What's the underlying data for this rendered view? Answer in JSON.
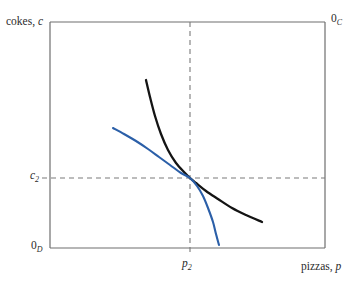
{
  "chart_data": {
    "type": "line",
    "title": "",
    "xlabel": "pizzas, p",
    "ylabel": "cokes, c",
    "grid": false,
    "legend_position": "none",
    "origin_labels": {
      "bottom_left": "0",
      "bottom_left_sub": "D",
      "top_right": "0",
      "top_right_sub": "C"
    },
    "axis_box": {
      "x_min_px": 50,
      "x_max_px": 325,
      "y_min_px": 22,
      "y_max_px": 248
    },
    "ticks": {
      "x": [
        {
          "label": "p",
          "sub": "2",
          "px": 190
        }
      ],
      "y": [
        {
          "label": "c",
          "sub": "2",
          "px": 178
        }
      ]
    },
    "reference_lines": [
      {
        "name": "vertical-dashed-p2",
        "orientation": "vertical",
        "value_px": 190,
        "style": "dashed",
        "color": "#7a7a7a"
      },
      {
        "name": "horizontal-dashed-c2",
        "orientation": "horizontal",
        "value_px": 178,
        "style": "dashed",
        "color": "#7a7a7a"
      }
    ],
    "series": [
      {
        "name": "indifference-curve-black",
        "color": "#141414",
        "width": 2.3,
        "points": [
          [
            146,
            80
          ],
          [
            150,
            97
          ],
          [
            155,
            116
          ],
          [
            161,
            134
          ],
          [
            168,
            150
          ],
          [
            176,
            163
          ],
          [
            185,
            173
          ],
          [
            190,
            178
          ],
          [
            196,
            183
          ],
          [
            206,
            191
          ],
          [
            218,
            199
          ],
          [
            232,
            208
          ],
          [
            246,
            215
          ],
          [
            262,
            222
          ]
        ]
      },
      {
        "name": "indifference-curve-blue",
        "color": "#2b5fa8",
        "width": 2.1,
        "points": [
          [
            113,
            128
          ],
          [
            124,
            134
          ],
          [
            136,
            141
          ],
          [
            148,
            149
          ],
          [
            159,
            157
          ],
          [
            170,
            165
          ],
          [
            181,
            173
          ],
          [
            190,
            178
          ],
          [
            197,
            186
          ],
          [
            203,
            196
          ],
          [
            208,
            208
          ],
          [
            213,
            222
          ],
          [
            216,
            234
          ],
          [
            219,
            245
          ]
        ]
      }
    ],
    "intersection_point_px": [
      190,
      178
    ]
  },
  "labels": {
    "y_axis": "cokes, ",
    "y_axis_var": "c",
    "x_axis": "pizzas, ",
    "x_axis_var": "p",
    "origin_d": "0",
    "origin_d_sub": "D",
    "origin_c": "0",
    "origin_c_sub": "C",
    "tick_c2_var": "c",
    "tick_c2_sub": "2",
    "tick_p2_var": "p",
    "tick_p2_sub": "2"
  },
  "colors": {
    "curve_black": "#141414",
    "curve_blue": "#2b5fa8",
    "axis": "#6e6e6e",
    "dashed": "#7a7a7a",
    "text": "#2b2b2b",
    "background": "#ffffff"
  }
}
